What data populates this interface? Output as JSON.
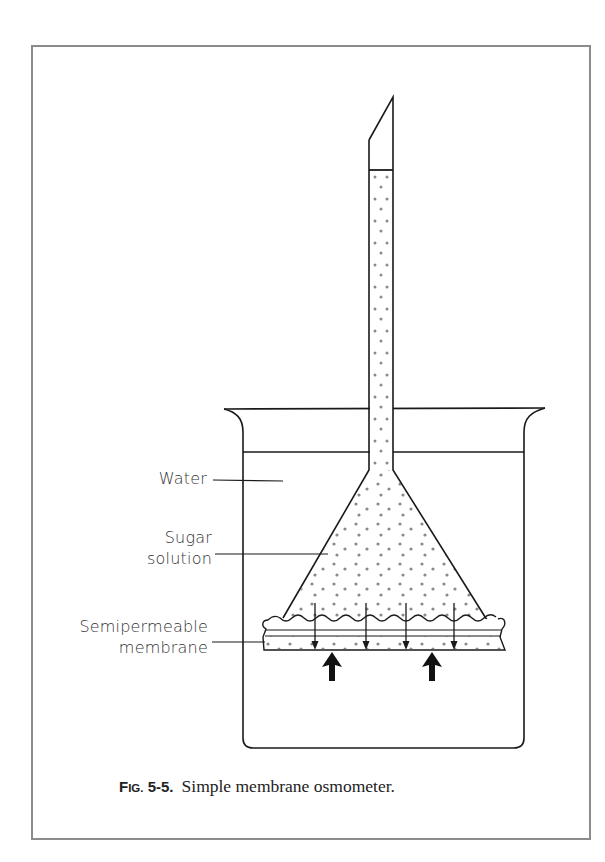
{
  "figure": {
    "label_prefix_cap": "F",
    "label_prefix_small": "IG.",
    "number": "5-5.",
    "title": "Simple membrane osmometer."
  },
  "labels": {
    "water": "Water",
    "sugar_line1": "Sugar",
    "sugar_line2": "solution",
    "membrane_line1": "Semipermeable",
    "membrane_line2": "membrane"
  },
  "diagram": {
    "components": [
      "thistle tube",
      "beaker",
      "water",
      "sugar solution",
      "semipermeable membrane"
    ],
    "flow_arrows": {
      "water_inflow_thin_down": 4,
      "water_inflow_thick_up": 2
    },
    "colors": {
      "line": "#1a1a1a",
      "dots": "#8a8a8a",
      "frame": "#8c8c8c"
    }
  }
}
